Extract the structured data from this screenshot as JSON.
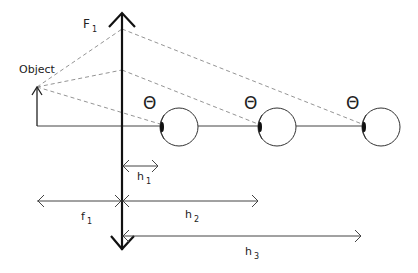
{
  "diagram": {
    "labels": {
      "object": "Object",
      "lens_focal": {
        "main": "F",
        "sub": "1"
      },
      "theta": "Θ",
      "h1": {
        "main": "h",
        "sub": "1"
      },
      "h2": {
        "main": "h",
        "sub": "2"
      },
      "h3": {
        "main": "h",
        "sub": "3"
      },
      "f1": {
        "main": "f",
        "sub": "1"
      }
    },
    "elements": {
      "lens": "converging lens (double-headed vertical arrow)",
      "object": "upright object arrow",
      "eyes": [
        "eye at position h1",
        "eye at position h2",
        "eye at position h3"
      ],
      "rays": "dashed ray lines from object through lens to each eye"
    },
    "colors": {
      "line": "#222222",
      "dashed": "#888888",
      "background": "#ffffff"
    }
  }
}
